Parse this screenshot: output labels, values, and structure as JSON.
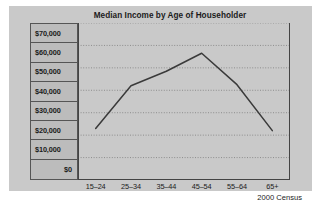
{
  "panel": {
    "background_color": "#c9c9c9",
    "page_background_color": "#ffffff"
  },
  "chart_data": {
    "type": "line",
    "title": "Median Income by Age of Householder",
    "xlabel": "",
    "ylabel": "",
    "categories": [
      "15–24",
      "25–34",
      "35–44",
      "45–54",
      "55–64",
      "65+"
    ],
    "values": [
      23000,
      42000,
      48500,
      56500,
      42500,
      22000
    ],
    "series": [
      {
        "name": "Median Income",
        "values": [
          23000,
          42000,
          48500,
          56500,
          42500,
          22000
        ]
      }
    ],
    "ylim": [
      0,
      70000
    ],
    "ytick_values": [
      70000,
      60000,
      50000,
      40000,
      30000,
      20000,
      10000,
      0
    ],
    "ytick_labels": [
      "$70,000",
      "$60,000",
      "$50,000",
      "$40,000",
      "$30,000",
      "$20,000",
      "$10,000",
      "$0"
    ],
    "grid": true,
    "grid_style": "dotted-horizontal",
    "legend": "none",
    "annotation": "2000 Census",
    "line_color": "#3a3a3a",
    "grid_color": "#7d7d7d",
    "axis_color": "#444444",
    "markers": "none"
  },
  "annotations": {
    "source": "2000 Census"
  },
  "artifact": {
    "bottom_text": ""
  }
}
